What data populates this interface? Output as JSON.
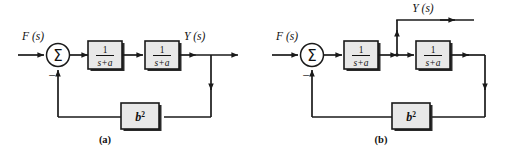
{
  "figure": {
    "background_color": "#ffffff",
    "line_color": "#1a1a1a",
    "block_fill_color": "#e8e8e8",
    "width": 507,
    "height": 153
  },
  "panels": [
    {
      "id": "a",
      "caption": "(a)",
      "input_label": "F (s)",
      "input_label_plain": "F(s)",
      "output_label": "Y (s)",
      "output_label_plain": "Y(s)",
      "summing_junction": {
        "symbol": "Σ",
        "name": "summing-junction",
        "negative_sign": "−",
        "input_signs": [
          "+",
          "−"
        ]
      },
      "blocks": [
        {
          "name": "transfer-function-block-1",
          "numerator": "1",
          "denominator": "s+a",
          "expression": "1/(s+a)"
        },
        {
          "name": "transfer-function-block-2",
          "numerator": "1",
          "denominator": "s+a",
          "expression": "1/(s+a)"
        },
        {
          "name": "feedback-gain-block",
          "base": "b",
          "exponent": "2",
          "expression": "b^2"
        }
      ],
      "output_tap": "after-second-block"
    },
    {
      "id": "b",
      "caption": "(b)",
      "input_label": "F (s)",
      "input_label_plain": "F(s)",
      "output_label": "Y (s)",
      "output_label_plain": "Y(s)",
      "summing_junction": {
        "symbol": "Σ",
        "name": "summing-junction",
        "negative_sign": "−",
        "input_signs": [
          "+",
          "−"
        ]
      },
      "blocks": [
        {
          "name": "transfer-function-block-1",
          "numerator": "1",
          "denominator": "s+a",
          "expression": "1/(s+a)"
        },
        {
          "name": "transfer-function-block-2",
          "numerator": "1",
          "denominator": "s+a",
          "expression": "1/(s+a)"
        },
        {
          "name": "feedback-gain-block",
          "base": "b",
          "exponent": "2",
          "expression": "b^2"
        }
      ],
      "output_tap": "between-blocks"
    }
  ]
}
